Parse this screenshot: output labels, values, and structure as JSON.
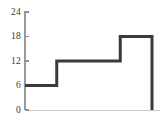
{
  "chart_data": {
    "type": "line",
    "subtype": "step",
    "title": "",
    "xlabel": "",
    "ylabel": "",
    "ylim": [
      0,
      24
    ],
    "xlim": [
      0,
      4
    ],
    "yticks": [
      0,
      6,
      12,
      18,
      24
    ],
    "ytick_labels": [
      "0",
      "6",
      "12",
      "18",
      "24"
    ],
    "xticks": [],
    "xtick_labels": [],
    "grid": false,
    "legend": null,
    "series": [
      {
        "name": "step",
        "step_mode": "post",
        "x": [
          0,
          1,
          1,
          3,
          3,
          4,
          4
        ],
        "y": [
          6,
          6,
          12,
          12,
          18,
          18,
          0
        ],
        "segments": [
          {
            "from_x": 0,
            "to_x": 1,
            "value": 6
          },
          {
            "from_x": 1,
            "to_x": 3,
            "value": 12
          },
          {
            "from_x": 3,
            "to_x": 4,
            "value": 18
          }
        ],
        "color": "#3a3a3a",
        "line_width": 3
      }
    ],
    "axis_color": "#9a9a9a",
    "baseline_color": "#c8c8c8",
    "background_color": "#ffffff"
  },
  "geometry": {
    "axis_x": 25,
    "baseline_y": 110,
    "top_y": 12,
    "right_x": 152,
    "break1_x": 43,
    "break2_x": 119.5,
    "y_for_6": 85.5,
    "y_for_12": 61,
    "y_for_18": 36.5,
    "tick_length": 4
  }
}
